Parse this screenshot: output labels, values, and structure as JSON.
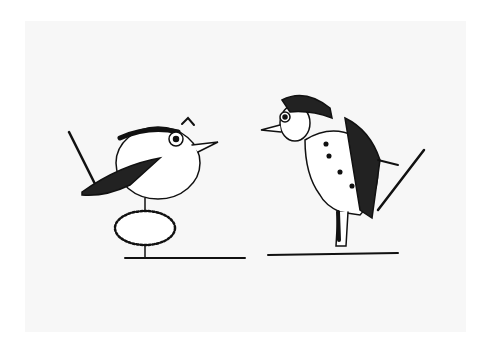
{
  "image": {
    "description": "Pen-and-ink illustration of a round bird standing on a small nest/bush facing a bird-headed gentleman in a tailcoat holding a cane",
    "colors": {
      "background": "#ffffff",
      "paper": "#f7f7f7",
      "ink": "#111111"
    },
    "figures": [
      {
        "name": "round-bird",
        "position": "left"
      },
      {
        "name": "nest",
        "position": "left-bottom"
      },
      {
        "name": "bird-gentleman",
        "position": "right"
      },
      {
        "name": "cane",
        "position": "right"
      }
    ]
  }
}
